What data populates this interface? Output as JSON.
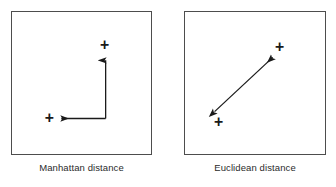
{
  "figure": {
    "width": 336,
    "height": 187,
    "background_color": "#ffffff",
    "stroke_color": "#1a1a1a",
    "border_color": "#4d4d4d",
    "caption_color": "#2b2b2b"
  },
  "panels": [
    {
      "id": "manhattan",
      "caption": "Manhattan distance",
      "box": {
        "x": 11,
        "y": 11,
        "width": 141,
        "height": 144
      },
      "markers": [
        {
          "name": "point-upper-right",
          "x": 105,
          "y": 45,
          "glyph": "+"
        },
        {
          "name": "point-lower-left",
          "x": 49,
          "y": 119,
          "glyph": "+"
        }
      ],
      "path": {
        "type": "orthogonal-L",
        "corner": {
          "x": 106,
          "y": 119
        },
        "vertical_from": {
          "x": 106,
          "y": 119
        },
        "vertical_to": {
          "x": 106,
          "y": 57
        },
        "horizontal_from": {
          "x": 106,
          "y": 119
        },
        "horizontal_to": {
          "x": 57,
          "y": 119
        },
        "arrowheads": [
          "up",
          "left"
        ]
      }
    },
    {
      "id": "euclidean",
      "caption": "Euclidean distance",
      "box": {
        "x": 184,
        "y": 11,
        "width": 142,
        "height": 144
      },
      "markers": [
        {
          "name": "point-upper-right",
          "x": 280,
          "y": 47,
          "glyph": "+"
        },
        {
          "name": "point-lower-left",
          "x": 218,
          "y": 123,
          "glyph": "+"
        }
      ],
      "path": {
        "type": "straight-diagonal",
        "from": {
          "x": 214,
          "y": 112
        },
        "to": {
          "x": 273,
          "y": 57
        },
        "arrowheads": [
          "both"
        ]
      }
    }
  ]
}
